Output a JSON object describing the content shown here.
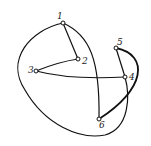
{
  "diagram": {
    "type": "graph",
    "nodes": [
      {
        "id": "1",
        "label": "1",
        "x": 63,
        "y": 23
      },
      {
        "id": "2",
        "label": "2",
        "x": 78,
        "y": 59
      },
      {
        "id": "3",
        "label": "3",
        "x": 36,
        "y": 71
      },
      {
        "id": "4",
        "label": "4",
        "x": 125,
        "y": 77
      },
      {
        "id": "5",
        "label": "5",
        "x": 116,
        "y": 48
      },
      {
        "id": "6",
        "label": "6",
        "x": 99,
        "y": 119
      }
    ],
    "edges": [
      {
        "from": "1",
        "to": "2",
        "style": "straight"
      },
      {
        "from": "2",
        "to": "3",
        "style": "straight"
      },
      {
        "from": "3",
        "to": "4",
        "style": "curve"
      },
      {
        "from": "1",
        "to": "6",
        "style": "curve"
      },
      {
        "from": "5",
        "to": "4",
        "style": "straight"
      },
      {
        "from": "5",
        "to": "6",
        "style": "curve"
      },
      {
        "from": "1",
        "to": "4",
        "style": "outer-loop"
      }
    ]
  }
}
